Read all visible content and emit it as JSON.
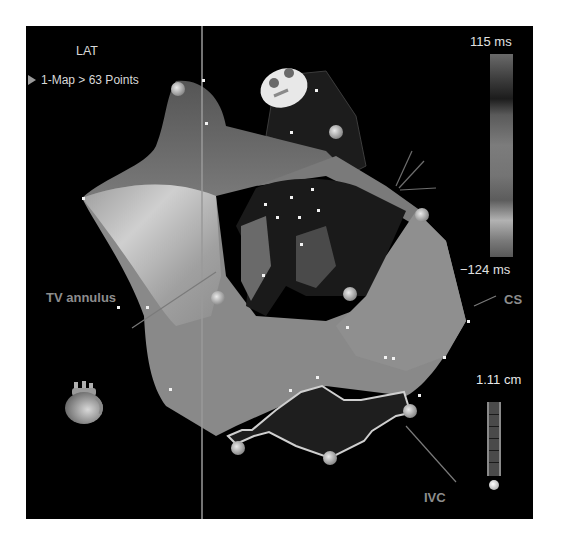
{
  "viewer": {
    "map_type": "LAT",
    "breadcrumb": "1-Map > 63 Points",
    "breadcrumb_icon": "play-triangle-icon",
    "points_count": 63
  },
  "colorbar": {
    "max_label": "115 ms",
    "min_label": "−124 ms",
    "max_value_ms": 115,
    "min_value_ms": -124,
    "colormap": "grayscale"
  },
  "scale": {
    "label": "1.11 cm",
    "value_cm": 1.11
  },
  "annotations": {
    "tv_annulus": "TV annulus",
    "cs": "CS",
    "ivc": "IVC"
  },
  "icons": {
    "orientation": "heart-orientation-icon"
  },
  "colors": {
    "background": "#000000",
    "frame": "#ffffff",
    "surface": "#8a8a8a",
    "text": "#d8d8d8",
    "annotation": "#8d8d8d"
  }
}
